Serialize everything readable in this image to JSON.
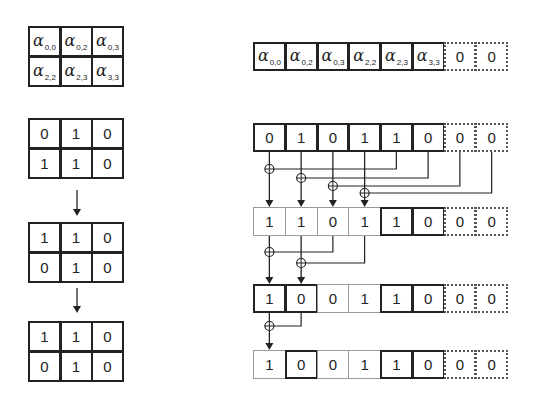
{
  "left_panel": {
    "coefficient_matrix": [
      [
        {
          "sym": "α",
          "sub": "0,0"
        },
        {
          "sym": "α",
          "sub": "0,2"
        },
        {
          "sym": "α",
          "sub": "0,3"
        }
      ],
      [
        {
          "sym": "α",
          "sub": "2,2"
        },
        {
          "sym": "α",
          "sub": "2,3"
        },
        {
          "sym": "α",
          "sub": "3,3"
        }
      ]
    ],
    "matrices": [
      [
        [
          "0",
          "1",
          "0"
        ],
        [
          "1",
          "1",
          "0"
        ]
      ],
      [
        [
          "1",
          "1",
          "0"
        ],
        [
          "0",
          "1",
          "0"
        ]
      ],
      [
        [
          "1",
          "1",
          "0"
        ],
        [
          "0",
          "1",
          "0"
        ]
      ]
    ],
    "arrows": [
      "down-arrow",
      "down-arrow"
    ]
  },
  "right_panel": {
    "coefficient_row": [
      {
        "sym": "α",
        "sub": "0,0",
        "border": "dark"
      },
      {
        "sym": "α",
        "sub": "0,2",
        "border": "dark"
      },
      {
        "sym": "α",
        "sub": "0,3",
        "border": "dark"
      },
      {
        "sym": "α",
        "sub": "2,2",
        "border": "dark"
      },
      {
        "sym": "α",
        "sub": "2,3",
        "border": "dark"
      },
      {
        "sym": "α",
        "sub": "3,3",
        "border": "dark"
      },
      {
        "text": "0",
        "border": "dotted"
      },
      {
        "text": "0",
        "border": "dotted"
      }
    ],
    "rows": [
      {
        "values": [
          "0",
          "1",
          "0",
          "1",
          "1",
          "0",
          "0",
          "0"
        ],
        "borders": [
          "dark",
          "dark",
          "dark",
          "dark",
          "dark",
          "dark",
          "dotted",
          "dotted"
        ]
      },
      {
        "values": [
          "1",
          "1",
          "0",
          "1",
          "1",
          "0",
          "0",
          "0"
        ],
        "borders": [
          "light",
          "light",
          "light",
          "light",
          "dark",
          "dark",
          "dotted",
          "dotted"
        ]
      },
      {
        "values": [
          "1",
          "0",
          "0",
          "1",
          "1",
          "0",
          "0",
          "0"
        ],
        "borders": [
          "dark",
          "dark",
          "light",
          "light",
          "dark",
          "dark",
          "dotted",
          "dotted"
        ]
      },
      {
        "values": [
          "1",
          "0",
          "0",
          "1",
          "1",
          "0",
          "0",
          "0"
        ],
        "borders": [
          "light",
          "dark",
          "light",
          "light",
          "dark",
          "dark",
          "dotted",
          "dotted"
        ]
      }
    ],
    "xor_stages": [
      {
        "from_row": 0,
        "ops": [
          {
            "target": 0,
            "source": 4
          },
          {
            "target": 1,
            "source": 5
          },
          {
            "target": 2,
            "source": 6
          },
          {
            "target": 3,
            "source": 7
          }
        ]
      },
      {
        "from_row": 1,
        "ops": [
          {
            "target": 0,
            "source": 2
          },
          {
            "target": 1,
            "source": 3
          }
        ]
      },
      {
        "from_row": 2,
        "ops": [
          {
            "target": 0,
            "source": 1
          }
        ]
      }
    ],
    "xor_symbol": "⊕"
  },
  "colors": {
    "ink": "#222222",
    "light_border": "#9a9a9a",
    "dotted_border": "#555555",
    "background": "#ffffff"
  }
}
